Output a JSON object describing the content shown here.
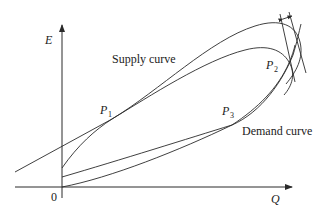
{
  "diagram": {
    "axes": {
      "y_label": "E",
      "x_label": "Q",
      "origin_label": "0"
    },
    "curves": [
      {
        "name": "supply-curve",
        "label": "Supply curve"
      },
      {
        "name": "demand-curve",
        "label": "Demand curve"
      }
    ],
    "points": [
      {
        "id": "P1",
        "letter": "P",
        "sub": "1"
      },
      {
        "id": "P2",
        "letter": "P",
        "sub": "2"
      },
      {
        "id": "P3",
        "letter": "P",
        "sub": "3"
      }
    ],
    "colors": {
      "line": "#2a2a2a",
      "background": "#ffffff"
    }
  }
}
